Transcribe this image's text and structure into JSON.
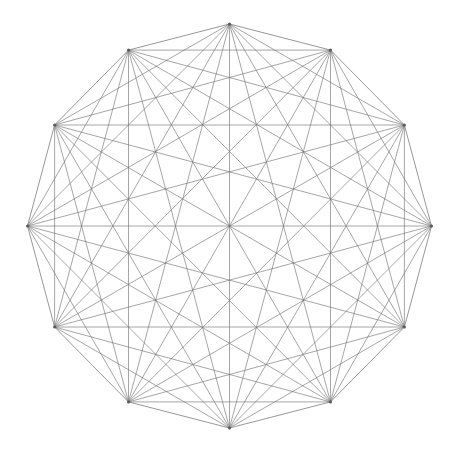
{
  "figure": {
    "kind": "complete-graph-diagram",
    "background_color": "#ffffff",
    "edge_color": "#6e6e6e",
    "hull_edge_color": "#707070",
    "vertex_color": "#5a5a5a",
    "edge_stroke_width": 0.62,
    "hull_stroke_width": 0.72,
    "vertex_radius": 1.5,
    "canvas": {
      "width": 454,
      "height": 452
    }
  },
  "chart_data": {
    "type": "scatter",
    "subtitle": "",
    "xlabel": "",
    "ylabel": "",
    "xlim": [
      0,
      454
    ],
    "ylim": [
      0,
      452
    ],
    "grid": false,
    "legend": "none",
    "graph": {
      "name": "K12",
      "vertex_count": 12,
      "edge_count": 66,
      "degree_per_vertex": 11,
      "layout": "regular polygon (circular)",
      "center": [
        229.5,
        226.0
      ],
      "radius": 202.0,
      "start_angle_deg": -90,
      "angle_step_deg": 30
    },
    "vertices": [
      {
        "id": 0,
        "label": "v0",
        "angle_deg": -90,
        "x": 229.5,
        "y": 24.0
      },
      {
        "id": 1,
        "label": "v1",
        "angle_deg": -60,
        "x": 330.5,
        "y": 50.1
      },
      {
        "id": 2,
        "label": "v2",
        "angle_deg": -30,
        "x": 404.4,
        "y": 125.0
      },
      {
        "id": 3,
        "label": "v3",
        "angle_deg": 0,
        "x": 431.5,
        "y": 226.0
      },
      {
        "id": 4,
        "label": "v4",
        "angle_deg": 30,
        "x": 404.4,
        "y": 327.0
      },
      {
        "id": 5,
        "label": "v5",
        "angle_deg": 60,
        "x": 330.5,
        "y": 401.9
      },
      {
        "id": 6,
        "label": "v6",
        "angle_deg": 90,
        "x": 229.5,
        "y": 428.0
      },
      {
        "id": 7,
        "label": "v7",
        "angle_deg": 120,
        "x": 128.5,
        "y": 401.9
      },
      {
        "id": 8,
        "label": "v8",
        "angle_deg": 150,
        "x": 54.6,
        "y": 327.0
      },
      {
        "id": 9,
        "label": "v9",
        "angle_deg": 180,
        "x": 27.5,
        "y": 226.0
      },
      {
        "id": 10,
        "label": "v10",
        "angle_deg": 210,
        "x": 54.6,
        "y": 125.0
      },
      {
        "id": 11,
        "label": "v11",
        "angle_deg": 240,
        "x": 128.5,
        "y": 50.1
      }
    ],
    "edges": [
      [
        0,
        1
      ],
      [
        0,
        2
      ],
      [
        0,
        3
      ],
      [
        0,
        4
      ],
      [
        0,
        5
      ],
      [
        0,
        6
      ],
      [
        0,
        7
      ],
      [
        0,
        8
      ],
      [
        0,
        9
      ],
      [
        0,
        10
      ],
      [
        0,
        11
      ],
      [
        1,
        2
      ],
      [
        1,
        3
      ],
      [
        1,
        4
      ],
      [
        1,
        5
      ],
      [
        1,
        6
      ],
      [
        1,
        7
      ],
      [
        1,
        8
      ],
      [
        1,
        9
      ],
      [
        1,
        10
      ],
      [
        1,
        11
      ],
      [
        2,
        3
      ],
      [
        2,
        4
      ],
      [
        2,
        5
      ],
      [
        2,
        6
      ],
      [
        2,
        7
      ],
      [
        2,
        8
      ],
      [
        2,
        9
      ],
      [
        2,
        10
      ],
      [
        2,
        11
      ],
      [
        3,
        4
      ],
      [
        3,
        5
      ],
      [
        3,
        6
      ],
      [
        3,
        7
      ],
      [
        3,
        8
      ],
      [
        3,
        9
      ],
      [
        3,
        10
      ],
      [
        3,
        11
      ],
      [
        4,
        5
      ],
      [
        4,
        6
      ],
      [
        4,
        7
      ],
      [
        4,
        8
      ],
      [
        4,
        9
      ],
      [
        4,
        10
      ],
      [
        4,
        11
      ],
      [
        5,
        6
      ],
      [
        5,
        7
      ],
      [
        5,
        8
      ],
      [
        5,
        9
      ],
      [
        5,
        10
      ],
      [
        5,
        11
      ],
      [
        6,
        7
      ],
      [
        6,
        8
      ],
      [
        6,
        9
      ],
      [
        6,
        10
      ],
      [
        6,
        11
      ],
      [
        7,
        8
      ],
      [
        7,
        9
      ],
      [
        7,
        10
      ],
      [
        7,
        11
      ],
      [
        8,
        9
      ],
      [
        8,
        10
      ],
      [
        8,
        11
      ],
      [
        9,
        10
      ],
      [
        9,
        11
      ],
      [
        10,
        11
      ]
    ]
  }
}
